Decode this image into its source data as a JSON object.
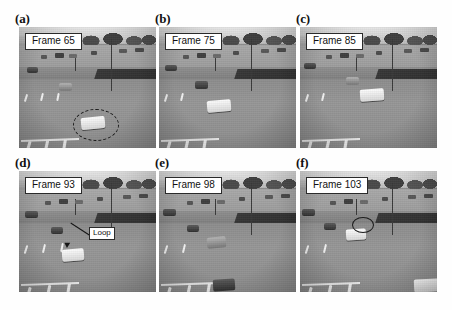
{
  "figure": {
    "kind": "multi-panel-figure",
    "panel_count": 6,
    "columns": 3,
    "rows": 2,
    "background_color": "#ffffff",
    "caption_box_bg": "#ffffff",
    "caption_box_border": "#2a2a2a"
  },
  "panels": [
    {
      "letter": "(a)",
      "frame_label": "Frame 65",
      "annotation": null,
      "marker": "dashed-ellipse",
      "marker_note": "dashed ellipse around tracked white car in near lane"
    },
    {
      "letter": "(b)",
      "frame_label": "Frame 75",
      "annotation": null,
      "marker": "none",
      "marker_note": ""
    },
    {
      "letter": "(c)",
      "frame_label": "Frame 85",
      "annotation": null,
      "marker": "none",
      "marker_note": ""
    },
    {
      "letter": "(d)",
      "frame_label": "Frame 93",
      "annotation": "Loop",
      "marker": "leader-line",
      "marker_note": "Loop label with leader line pointing down-left to road loop detector"
    },
    {
      "letter": "(e)",
      "frame_label": "Frame 98",
      "annotation": null,
      "marker": "none",
      "marker_note": ""
    },
    {
      "letter": "(f)",
      "frame_label": "Frame 103",
      "annotation": null,
      "marker": "solid-ellipse",
      "marker_note": "solid ellipse outline around vehicle over the loop"
    }
  ]
}
